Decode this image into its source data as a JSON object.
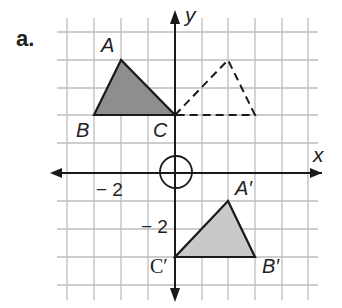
{
  "part_label": "a.",
  "axes": {
    "x_label": "x",
    "y_label": "y",
    "x_tick_label": "− 2",
    "y_tick_label": "− 2",
    "origin_marker": "circle-at-origin"
  },
  "grid": {
    "x_range": [
      -4,
      5
    ],
    "y_range": [
      -4,
      5
    ],
    "unit_px": 27,
    "line_color": "#b8b8b8"
  },
  "triangles": {
    "original": {
      "name": "ABC",
      "style": "filled",
      "fill": "#8f8f8f",
      "vertices": {
        "A": [
          -2,
          4
        ],
        "B": [
          -3,
          2
        ],
        "C": [
          0,
          2
        ]
      }
    },
    "intermediate": {
      "name": "reflection",
      "style": "dashed",
      "vertices": [
        [
          0,
          2
        ],
        [
          2,
          4
        ],
        [
          3,
          2
        ]
      ]
    },
    "image": {
      "name": "A'B'C'",
      "style": "filled",
      "fill": "#c8c8c8",
      "vertices": {
        "A'": [
          2,
          -1
        ],
        "B'": [
          3,
          -3
        ],
        "C'": [
          0,
          -3
        ]
      }
    }
  },
  "labels": {
    "A": "A",
    "B": "B",
    "C": "C",
    "A_prime": "A′",
    "B_prime": "B′",
    "C_prime": "C′"
  }
}
